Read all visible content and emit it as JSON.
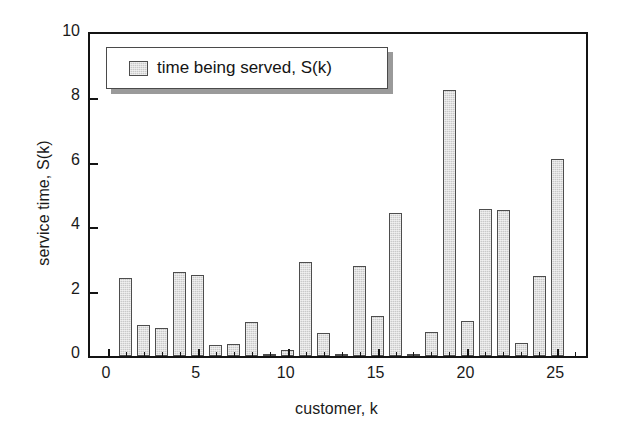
{
  "chart_data": {
    "type": "bar",
    "title": "",
    "xlabel": "customer, k",
    "ylabel": "service time, S(k)",
    "xlim": [
      -1,
      26.6
    ],
    "ylim": [
      0,
      10
    ],
    "xticks": [
      0,
      5,
      10,
      15,
      20,
      25
    ],
    "yticks": [
      0,
      2,
      4,
      6,
      8,
      10
    ],
    "grid": false,
    "legend_position": "upper-left-inside",
    "series": [
      {
        "name": "time being served, S(k)",
        "categories": [
          1,
          2,
          3,
          4,
          5,
          6,
          7,
          8,
          9,
          10,
          11,
          12,
          13,
          14,
          15,
          16,
          17,
          18,
          19,
          20,
          21,
          22,
          23,
          24,
          25
        ],
        "values": [
          2.42,
          0.97,
          0.88,
          2.62,
          2.52,
          0.35,
          0.38,
          1.05,
          0.03,
          0.18,
          2.92,
          0.72,
          0.05,
          2.8,
          1.25,
          4.45,
          0.04,
          0.75,
          8.25,
          1.1,
          4.58,
          4.52,
          0.4,
          2.48,
          6.12
        ]
      }
    ]
  },
  "legend": {
    "label": "time being served, S(k)",
    "swatch_color": "#c9c9c9",
    "swatch_border": "#4d4d4d"
  },
  "axes": {
    "y_title": "service time, S(k)",
    "x_title": "customer, k",
    "y_tick_labels": [
      "0",
      "2",
      "4",
      "6",
      "8",
      "10"
    ],
    "x_tick_labels": [
      "0",
      "5",
      "10",
      "15",
      "20",
      "25"
    ],
    "frame_color": "#141414"
  }
}
